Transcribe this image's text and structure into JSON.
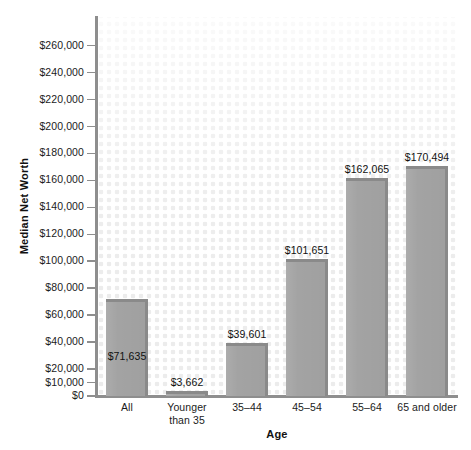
{
  "chart_data": {
    "type": "bar",
    "title": "",
    "xlabel": "Age",
    "ylabel": "Median Net Worth",
    "categories": [
      "All",
      "Younger\nthan 35",
      "35–44",
      "45–54",
      "55–64",
      "65 and older"
    ],
    "values": [
      71635,
      3662,
      39601,
      101651,
      162065,
      170494
    ],
    "value_labels": [
      "$71,635",
      "$3,662",
      "$39,601",
      "$101,651",
      "$162,065",
      "$170,494"
    ],
    "ylim": [
      0,
      266000
    ],
    "yticks": [
      0,
      10000,
      20000,
      40000,
      60000,
      80000,
      100000,
      120000,
      140000,
      160000,
      180000,
      200000,
      220000,
      240000,
      260000
    ],
    "ytick_labels": [
      "$0",
      "$10,000",
      "$20,000",
      "$40,000",
      "$60,000",
      "$80,000",
      "$100,000",
      "$120,000",
      "$140,000",
      "$160,000",
      "$180,000",
      "$200,000",
      "$220,000",
      "$240,000",
      "$260,000"
    ],
    "grid": false,
    "legend": null,
    "bar_color": "#a3a3a3",
    "bar_edge_color": "#8a8a8a",
    "axis_color": "#8e8e8e",
    "background_dot_color": "#ececec"
  }
}
